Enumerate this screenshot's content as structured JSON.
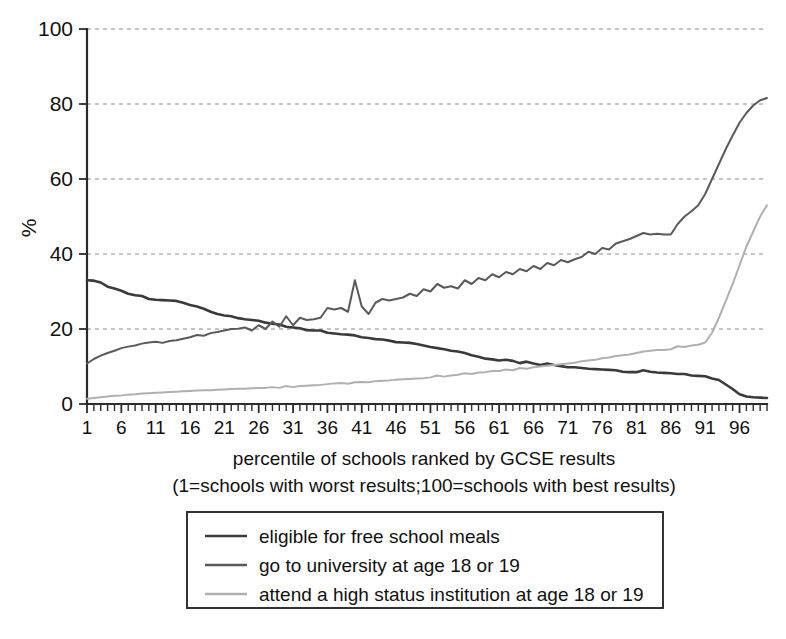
{
  "chart_data": {
    "type": "line",
    "title": "",
    "xlabel": "percentile of schools ranked by GCSE results",
    "xlabel_note": "(1=schools with worst results;100=schools with best results)",
    "ylabel": "%",
    "xlim": [
      1,
      100
    ],
    "ylim": [
      0,
      100
    ],
    "yticks": [
      0,
      20,
      40,
      60,
      80,
      100
    ],
    "ytick_labels": [
      "0",
      "20",
      "40",
      "60",
      "80",
      "100"
    ],
    "xticks": [
      1,
      6,
      11,
      16,
      21,
      26,
      31,
      36,
      41,
      46,
      51,
      56,
      61,
      66,
      71,
      76,
      81,
      86,
      91,
      96
    ],
    "xtick_labels": [
      "1",
      "6",
      "11",
      "16",
      "21",
      "26",
      "31",
      "36",
      "41",
      "46",
      "51",
      "56",
      "61",
      "66",
      "71",
      "76",
      "81",
      "86",
      "91",
      "96"
    ],
    "grid": "horizontal dashed at 20,40,60,80,100",
    "legend_position": "below-plot-centered",
    "x": [
      1,
      2,
      3,
      4,
      5,
      6,
      7,
      8,
      9,
      10,
      11,
      12,
      13,
      14,
      15,
      16,
      17,
      18,
      19,
      20,
      21,
      22,
      23,
      24,
      25,
      26,
      27,
      28,
      29,
      30,
      31,
      32,
      33,
      34,
      35,
      36,
      37,
      38,
      39,
      40,
      41,
      42,
      43,
      44,
      45,
      46,
      47,
      48,
      49,
      50,
      51,
      52,
      53,
      54,
      55,
      56,
      57,
      58,
      59,
      60,
      61,
      62,
      63,
      64,
      65,
      66,
      67,
      68,
      69,
      70,
      71,
      72,
      73,
      74,
      75,
      76,
      77,
      78,
      79,
      80,
      81,
      82,
      83,
      84,
      85,
      86,
      87,
      88,
      89,
      90,
      91,
      92,
      93,
      94,
      95,
      96,
      97,
      98,
      99,
      100
    ],
    "series": [
      {
        "name": "eligible for free school meals",
        "color": "#3a3a3a",
        "width": 2.6,
        "values": [
          33.0,
          32.9,
          32.4,
          31.3,
          30.8,
          30.2,
          29.4,
          29.0,
          28.8,
          28.0,
          27.8,
          27.7,
          27.6,
          27.5,
          27.0,
          26.4,
          26.0,
          25.4,
          24.6,
          24.0,
          23.6,
          23.4,
          22.9,
          22.6,
          22.4,
          22.2,
          21.7,
          21.4,
          21.2,
          20.6,
          20.4,
          20.2,
          19.7,
          19.6,
          19.6,
          19.0,
          18.8,
          18.6,
          18.5,
          18.3,
          17.8,
          17.6,
          17.3,
          17.2,
          16.9,
          16.5,
          16.4,
          16.3,
          16.0,
          15.6,
          15.2,
          14.9,
          14.6,
          14.2,
          14.0,
          13.6,
          13.0,
          12.6,
          12.1,
          11.9,
          11.6,
          11.8,
          11.5,
          10.9,
          11.3,
          10.8,
          10.4,
          10.8,
          10.4,
          10.1,
          9.8,
          9.8,
          9.6,
          9.4,
          9.3,
          9.2,
          9.1,
          9.0,
          8.6,
          8.5,
          8.5,
          9.0,
          8.6,
          8.4,
          8.3,
          8.2,
          8.0,
          8.0,
          7.6,
          7.5,
          7.4,
          6.8,
          6.4,
          5.2,
          4.0,
          2.6,
          2.0,
          1.8,
          1.7,
          1.6
        ]
      },
      {
        "name": "go to university at age 18 or 19",
        "color": "#5a5a5a",
        "width": 2.0,
        "values": [
          10.8,
          12.0,
          12.9,
          13.6,
          14.2,
          14.9,
          15.3,
          15.6,
          16.1,
          16.4,
          16.6,
          16.3,
          16.8,
          17.0,
          17.4,
          17.8,
          18.4,
          18.2,
          18.9,
          19.2,
          19.6,
          20.0,
          20.1,
          20.4,
          19.6,
          21.0,
          20.0,
          22.0,
          20.6,
          23.4,
          21.0,
          23.0,
          22.4,
          22.6,
          23.0,
          25.6,
          25.2,
          25.6,
          24.6,
          33.0,
          26.0,
          24.0,
          27.0,
          28.0,
          27.6,
          28.0,
          28.4,
          29.4,
          28.8,
          30.6,
          30.0,
          32.0,
          31.0,
          31.4,
          30.8,
          33.0,
          32.0,
          33.6,
          33.0,
          34.6,
          33.8,
          35.2,
          34.6,
          36.0,
          35.4,
          36.8,
          36.0,
          37.6,
          37.0,
          38.4,
          37.8,
          38.6,
          39.2,
          40.6,
          40.0,
          41.6,
          41.2,
          42.8,
          43.4,
          44.0,
          44.8,
          45.6,
          45.2,
          45.4,
          45.2,
          45.2,
          48.0,
          50.0,
          51.4,
          53.0,
          56.0,
          60.0,
          64.0,
          68.0,
          71.6,
          75.0,
          77.6,
          79.6,
          81.0,
          81.6
        ]
      },
      {
        "name": "attend a high status institution at age 18 or 19",
        "color": "#b0b0b0",
        "width": 2.0,
        "values": [
          1.4,
          1.6,
          1.8,
          2.0,
          2.2,
          2.3,
          2.5,
          2.6,
          2.8,
          2.9,
          3.0,
          3.1,
          3.2,
          3.3,
          3.4,
          3.5,
          3.6,
          3.7,
          3.7,
          3.8,
          3.9,
          4.0,
          4.1,
          4.1,
          4.2,
          4.3,
          4.3,
          4.5,
          4.3,
          4.8,
          4.5,
          4.8,
          4.9,
          5.0,
          5.1,
          5.3,
          5.5,
          5.6,
          5.4,
          5.8,
          5.9,
          5.8,
          6.1,
          6.2,
          6.3,
          6.5,
          6.6,
          6.7,
          6.8,
          6.9,
          7.1,
          7.6,
          7.3,
          7.6,
          7.8,
          8.2,
          8.0,
          8.4,
          8.5,
          8.8,
          8.8,
          9.2,
          9.0,
          9.6,
          9.4,
          9.8,
          10.0,
          10.2,
          10.4,
          10.6,
          10.8,
          11.0,
          11.4,
          11.6,
          11.8,
          12.2,
          12.4,
          12.8,
          13.0,
          13.2,
          13.6,
          14.0,
          14.2,
          14.4,
          14.4,
          14.6,
          15.4,
          15.2,
          15.6,
          15.8,
          16.4,
          19.0,
          23.0,
          27.5,
          32.0,
          37.0,
          42.0,
          46.0,
          50.0,
          53.0
        ]
      }
    ]
  },
  "legend": {
    "items": [
      {
        "label": "eligible for free school meals"
      },
      {
        "label": "go to university at age 18 or 19"
      },
      {
        "label": "attend a high status institution at age 18 or 19"
      }
    ]
  }
}
